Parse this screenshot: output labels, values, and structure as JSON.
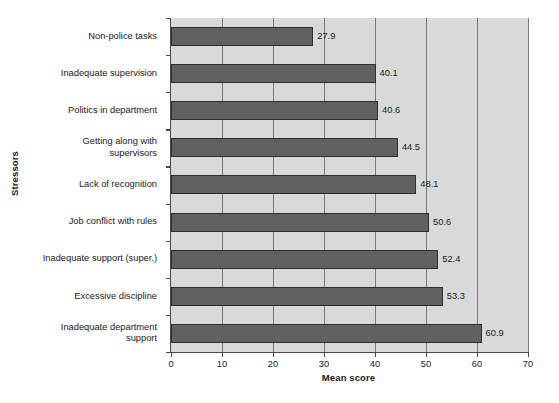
{
  "chart_data": {
    "type": "bar",
    "orientation": "horizontal",
    "title": "",
    "xlabel": "Mean score",
    "ylabel": "Stressors",
    "categories": [
      "Non-police tasks",
      "Inadequate supervision",
      "Politics in department",
      "Getting along with\nsupervisors",
      "Lack of recognition",
      "Job conflict with rules",
      "Inadequate support (super.)",
      "Excessive discipline",
      "Inadequate department\nsupport"
    ],
    "values": [
      27.9,
      40.1,
      40.6,
      44.5,
      48.1,
      50.6,
      52.4,
      53.3,
      60.9
    ],
    "value_labels": [
      "27.9",
      "40.1",
      "40.6",
      "44.5",
      "48.1",
      "50.6",
      "52.4",
      "53.3",
      "60.9"
    ],
    "xlim": [
      0,
      70
    ],
    "xticks": [
      0,
      10,
      20,
      30,
      40,
      50,
      60,
      70
    ],
    "xtick_labels": [
      "0",
      "10",
      "20",
      "30",
      "40",
      "50",
      "60",
      "70"
    ],
    "grid": "vertical",
    "legend": "none",
    "colors": {
      "bar_fill": "#616161",
      "bar_edge": "#2e2e2e",
      "plot_background": "#d9d9d9",
      "gridline": "#777777",
      "axis": "#4a4a4a",
      "text": "#1a1a1a",
      "figure_background": "#ffffff"
    }
  }
}
